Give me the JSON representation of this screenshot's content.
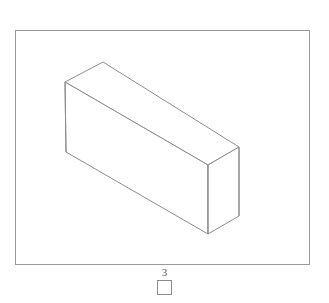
{
  "figure": {
    "title": "",
    "background_color": "#ffffff",
    "frame": {
      "stroke_color": "#9a9a9a",
      "stroke_width": 1,
      "x": 15,
      "y": 30,
      "width": 294,
      "height": 234
    },
    "shape": {
      "name": "rectangular-cuboid",
      "projection": "isometric",
      "stroke_color": "#8c8c8c",
      "fill_color": "#ffffff",
      "stroke_width": 1,
      "vertices": {
        "top_back_left": [
          65,
          82
        ],
        "top_back_apex": [
          103,
          62
        ],
        "top_right": [
          239,
          147
        ],
        "top_front": [
          208,
          165
        ],
        "bottom_left": [
          66,
          152
        ],
        "bottom_front": [
          208,
          234
        ],
        "bottom_right": [
          239,
          216
        ]
      },
      "faces": [
        {
          "name": "top-face",
          "points": "65,82 103,62 239,147 208,165"
        },
        {
          "name": "front-left-face",
          "points": "65,82 208,165 208,234 66,152"
        },
        {
          "name": "right-end-face",
          "points": "208,165 239,147 239,216 208,234"
        }
      ]
    }
  },
  "legend": {
    "number_label": "3",
    "swatch": {
      "name": "color-swatch",
      "fill": "#ffffff",
      "border": "#8a8a8a"
    }
  }
}
